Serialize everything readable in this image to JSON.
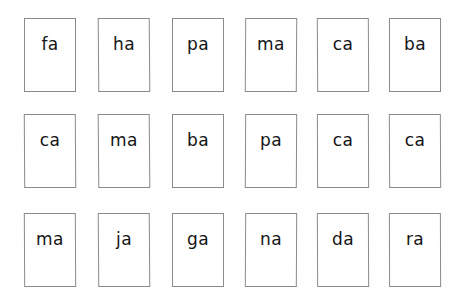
{
  "page": {
    "background_color": "#fefefe",
    "card_background_color": "#ffffff",
    "card_border_color": "#8a8a8a",
    "text_color": "#141414",
    "columns": 6,
    "rows": 3,
    "card_count": 18
  },
  "grid": {
    "rows": [
      {
        "row_index": 1,
        "cards": [
          {
            "label": "fa"
          },
          {
            "label": "ha"
          },
          {
            "label": "pa"
          },
          {
            "label": "ma"
          },
          {
            "label": "ca"
          },
          {
            "label": "ba"
          }
        ]
      },
      {
        "row_index": 2,
        "cards": [
          {
            "label": "ca"
          },
          {
            "label": "ma"
          },
          {
            "label": "ba"
          },
          {
            "label": "pa"
          },
          {
            "label": "ca"
          },
          {
            "label": "ca"
          }
        ]
      },
      {
        "row_index": 3,
        "cards": [
          {
            "label": "ma"
          },
          {
            "label": "ja"
          },
          {
            "label": "ga"
          },
          {
            "label": "na"
          },
          {
            "label": "da"
          },
          {
            "label": "ra"
          }
        ]
      }
    ]
  },
  "layout": {
    "row_tops": [
      18,
      114,
      213
    ],
    "column_lefts": [
      24,
      98,
      172,
      245,
      317,
      389
    ],
    "column_skews": [
      [
        0.0,
        0.45,
        0.0,
        -0.35,
        0.3,
        0.0
      ],
      [
        0.35,
        0.5,
        0.0,
        -0.3,
        0.2,
        0.25
      ],
      [
        0.3,
        0.4,
        0.0,
        -0.3,
        0.25,
        0.2
      ]
    ]
  }
}
